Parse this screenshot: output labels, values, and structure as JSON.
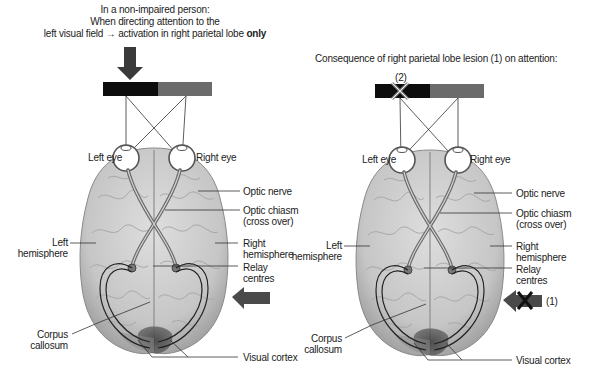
{
  "left_panel": {
    "title_lines": [
      "In a non-impaired person:",
      "When directing attention to the",
      "left visual field → activation in right parietal lobe"
    ],
    "title_emphasis": "only",
    "labels": {
      "left_eye": "Left eye",
      "right_eye": "Right eye",
      "optic_nerve": "Optic nerve",
      "optic_chiasm_1": "Optic chiasm",
      "optic_chiasm_2": "(cross over)",
      "left_hemisphere_1": "Left",
      "left_hemisphere_2": "hemisphere",
      "right_hemisphere_1": "Right",
      "right_hemisphere_2": "hemisphere",
      "relay_1": "Relay",
      "relay_2": "centres",
      "corpus_1": "Corpus",
      "corpus_2": "callosum",
      "visual_cortex": "Visual cortex"
    },
    "icons": [
      "down-arrow-icon",
      "left-arrow-icon"
    ]
  },
  "right_panel": {
    "title": "Consequence of right parietal lobe lesion (1) on attention:",
    "marker_2": "(2)",
    "marker_1": "(1)",
    "labels": {
      "left_eye": "Left eye",
      "right_eye": "Right eye",
      "optic_nerve": "Optic nerve",
      "optic_chiasm_1": "Optic chiasm",
      "optic_chiasm_2": "(cross over)",
      "left_hemisphere_1": "Left",
      "left_hemisphere_2": "hemisphere",
      "right_hemisphere_1": "Right",
      "right_hemisphere_2": "hemisphere",
      "relay_1": "Relay",
      "relay_2": "centres",
      "corpus_1": "Corpus",
      "corpus_2": "callosum",
      "visual_cortex": "Visual cortex"
    },
    "icons": [
      "crossed-out-field-icon",
      "blocked-left-arrow-icon"
    ]
  },
  "colors": {
    "field_left": "#0d0d0d",
    "field_right": "#6b6b6b",
    "brain": "#c9c9c9",
    "brain_dark": "#9c9c9c",
    "arrow": "#4a4a4a",
    "visual_cortex": "#3a3a3a"
  }
}
